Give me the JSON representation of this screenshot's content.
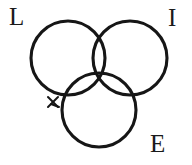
{
  "figure": {
    "kind": "venn-diagram",
    "title": "",
    "background_color": "#ffffff",
    "stroke_color": "#161616",
    "text_color": "#1a1a1a",
    "set_count": 3
  },
  "labels": {
    "top_left": "L",
    "top_right": "I",
    "bottom_right": "E"
  },
  "chart_data": {
    "type": "diagram",
    "diagram_type": "venn",
    "title": "",
    "sets": [
      {
        "name": "L",
        "label": "L",
        "label_position": "top-left",
        "cx": 68,
        "cy": 58,
        "r": 37
      },
      {
        "name": "I",
        "label": "I",
        "label_position": "top-right",
        "cx": 130,
        "cy": 58,
        "r": 37
      },
      {
        "name": "E",
        "label": "E",
        "label_position": "bottom-right",
        "cx": 99,
        "cy": 110,
        "r": 37
      }
    ],
    "annotations": [
      {
        "name": "x-mark",
        "shape": "x",
        "x": 53,
        "y": 102
      }
    ],
    "xlabel": "",
    "ylabel": "",
    "legend": []
  }
}
